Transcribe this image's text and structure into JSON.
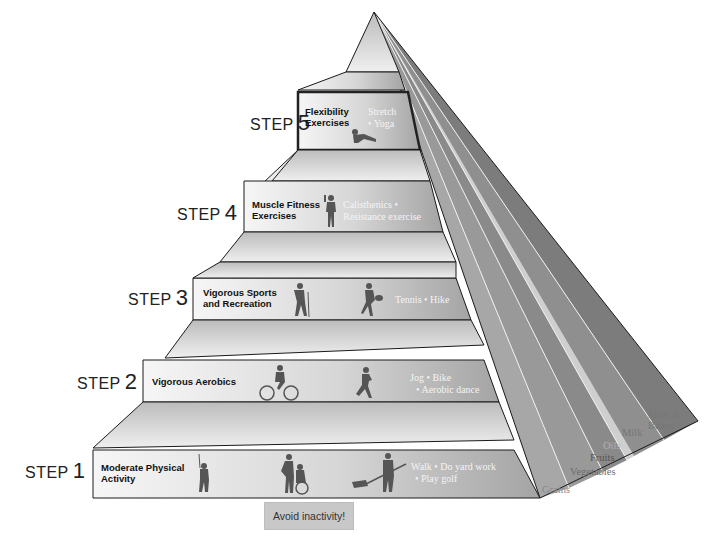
{
  "diagram": {
    "type": "activity-pyramid",
    "steps": [
      {
        "step_word": "STEP",
        "number": "5",
        "title_line1": "Flexibility",
        "title_line2": "Exercises",
        "acts_line1": "Stretch",
        "acts_line2": "• Yoga",
        "icons": [
          "stretching-person-icon"
        ]
      },
      {
        "step_word": "STEP",
        "number": "4",
        "title_line1": "Muscle Fitness",
        "title_line2": "Exercises",
        "acts_line1": "Calisthenics •",
        "acts_line2": "Resistance exercise",
        "icons": [
          "weightlifter-icon"
        ]
      },
      {
        "step_word": "STEP",
        "number": "3",
        "title_line1": "Vigorous Sports",
        "title_line2": "and Recreation",
        "acts_line1": "Tennis • Hike",
        "acts_line2": "",
        "icons": [
          "hiker-icon",
          "tennis-player-icon"
        ]
      },
      {
        "step_word": "STEP",
        "number": "2",
        "title_line1": "Vigorous Aerobics",
        "title_line2": "",
        "acts_line1": "Jog • Bike",
        "acts_line2": "• Aerobic dance",
        "icons": [
          "cyclist-icon",
          "runner-icon"
        ]
      },
      {
        "step_word": "STEP",
        "number": "1",
        "title_line1": "Moderate Physical",
        "title_line2": "Activity",
        "acts_line1": "Walk • Do yard work",
        "acts_line2": "• Play golf",
        "icons": [
          "golfer-icon",
          "wheelchair-helper-icon",
          "raking-person-icon"
        ]
      }
    ],
    "food_groups": [
      "Grains",
      "Vegetables",
      "Fruits",
      "Oils",
      "Milk",
      "Meat &",
      "Beans"
    ],
    "avoid_label": "Avoid inactivity!",
    "colors": {
      "tier_light": "#f2f2f2",
      "tier_dark": "#a9a9a9",
      "outline": "#1a1a1a",
      "active_tier_border": "#333333",
      "activity_text": "#f4f4f4",
      "stripe_grains": "#a7a7a7",
      "stripe_vegetables": "#999999",
      "stripe_fruits": "#8a8a8a",
      "stripe_oils": "#c9c9c9",
      "stripe_milk": "#8f8f8f",
      "stripe_meat": "#7d7d7d",
      "avoid_bg": "#c8c8c8"
    }
  }
}
